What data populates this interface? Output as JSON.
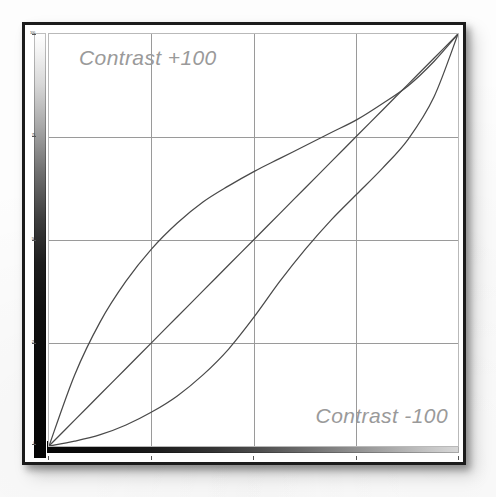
{
  "figure": {
    "kind": "tone-curve-dialog",
    "background_color": "#ffffff",
    "frame_color": "#1b1b1b"
  },
  "annotations": {
    "top_left_label": "Contrast +100",
    "bottom_right_label": "Contrast -100",
    "label_color": "#9a9a9a"
  },
  "ramps": {
    "output_ramp": {
      "name": "output-gradient-bar",
      "orientation": "vertical",
      "from": "#ffffff",
      "to": "#050505"
    },
    "input_ramp": {
      "name": "input-gradient-bar",
      "orientation": "horizontal",
      "from": "#070707",
      "to": "#d8d8d8"
    }
  },
  "axis": {
    "tick_labels": [
      "100",
      "75",
      "50",
      "25",
      "0"
    ],
    "tick_positions_pct": [
      0,
      25,
      50,
      75,
      100
    ]
  },
  "grid": {
    "vertical_pct": [
      25,
      50,
      75
    ],
    "horizontal_pct": [
      25,
      50,
      75
    ],
    "line_color": "#9a9a9a",
    "enabled": true
  },
  "chart_data": {
    "type": "line",
    "title": "",
    "subtitle": "",
    "xlabel": "Input",
    "ylabel": "Output",
    "xlim": [
      0,
      255
    ],
    "ylim": [
      0,
      255
    ],
    "grid": true,
    "legend_position": "none",
    "line_color": "#4a4a4a",
    "annotations": [
      "Contrast +100",
      "Contrast -100"
    ],
    "x": [
      0,
      16,
      32,
      48,
      64,
      80,
      96,
      112,
      128,
      144,
      160,
      176,
      192,
      208,
      224,
      240,
      255
    ],
    "series": [
      {
        "name": "Contrast +100",
        "description": "S-curve, steep through midpoint, bulges above the diagonal in the lower half",
        "values": [
          0,
          44,
          77,
          102,
          122,
          138,
          151,
          161,
          170,
          178,
          186,
          194,
          202,
          212,
          223,
          238,
          255
        ]
      },
      {
        "name": "Linear (no change)",
        "description": "straight 45-degree identity line",
        "values": [
          0,
          16,
          32,
          48,
          64,
          80,
          96,
          112,
          128,
          144,
          160,
          176,
          192,
          208,
          224,
          240,
          255
        ]
      },
      {
        "name": "Contrast -100",
        "description": "inverse S-curve, flat near the endpoints, bulges below the diagonal in the lower half",
        "values": [
          0,
          3,
          7,
          13,
          21,
          31,
          44,
          60,
          80,
          102,
          122,
          140,
          156,
          172,
          190,
          216,
          255
        ]
      }
    ]
  }
}
